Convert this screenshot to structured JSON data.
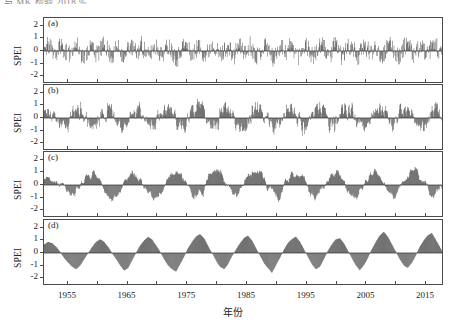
{
  "figure": {
    "top_caption": "与 MK 检验  2018 %",
    "panel_tags": [
      "(a)",
      "(b)",
      "(c)",
      "(d)"
    ],
    "y_axis_label": "SPEI",
    "y_ticks": [
      "2",
      "1",
      "0",
      "-1",
      "-2"
    ],
    "x_axis_title": "年份",
    "x_tick_labels": [
      "1955",
      "1965",
      "1975",
      "1985",
      "1995",
      "2005",
      "2015"
    ],
    "x_minor_ticks": [
      "1960",
      "1970",
      "1980",
      "1990",
      "2000",
      "2010"
    ],
    "colors": {
      "positive": "#3a3a3a",
      "negative": "#4a4a4a",
      "axis": "#4a4a4a",
      "text": "#1a1a1a"
    }
  },
  "chart_data": {
    "type": "line",
    "title": "",
    "subtitle": "",
    "xlabel": "年份",
    "ylabel": "SPEI",
    "xlim": [
      1951,
      2018
    ],
    "ylim": [
      -2.6,
      2.6
    ],
    "yticks": [
      2,
      1,
      0,
      -1,
      -2
    ],
    "xticks": [
      1955,
      1965,
      1975,
      1985,
      1995,
      2005,
      2015
    ],
    "grid": false,
    "legend": null,
    "panels": [
      {
        "tag": "(a)",
        "name": "SPEI-1",
        "ylabel": "SPEI",
        "ylim": [
          -2.6,
          2.6
        ],
        "seed": 11,
        "smooth": 1,
        "amplitude": 1.15,
        "values": [
          0.4,
          1.2,
          0.2,
          -0.6,
          1.5,
          0.3,
          -1.1,
          0.8,
          1.4,
          -0.3,
          -1.6,
          0.6,
          1.1,
          -0.8,
          0.2,
          1.7,
          -0.4,
          -1.2,
          0.9,
          0.1,
          -2.0,
          1.3,
          0.5,
          -0.7,
          1.6,
          -0.2,
          -1.4,
          0.7,
          1.0,
          -1.1,
          0.3,
          1.2,
          -0.5,
          -1.8,
          0.8,
          1.5,
          -0.1,
          -0.9,
          1.1,
          0.4,
          -1.3,
          0.6,
          1.8,
          -0.4,
          -1.0,
          0.9,
          0.2,
          -1.5,
          1.2,
          0.7,
          -0.8,
          1.4,
          -0.3,
          -1.2,
          0.5,
          1.6,
          -0.6,
          -2.2,
          0.8,
          1.0,
          -0.4,
          1.3,
          0.3,
          -1.1,
          0.9,
          1.5,
          -0.7,
          -1.3,
          0.6,
          1.2,
          -0.2,
          -0.9,
          1.4,
          0.5,
          -1.6,
          0.7,
          1.1,
          -0.3,
          -1.4,
          1.0,
          0.4,
          -0.8,
          1.7,
          -0.5,
          -1.1,
          0.8,
          1.3,
          -0.2,
          -1.5,
          0.6,
          1.9,
          -0.4,
          -1.0,
          1.2,
          0.3,
          -1.2,
          0.9,
          1.4,
          -0.6,
          -0.9
        ]
      },
      {
        "tag": "(b)",
        "name": "SPEI-3",
        "ylabel": "SPEI",
        "ylim": [
          -2.6,
          2.6
        ],
        "seed": 23,
        "smooth": 3,
        "amplitude": 1.2,
        "values": [
          0.5,
          0.9,
          1.1,
          0.3,
          -0.5,
          -1.2,
          -0.8,
          0.4,
          1.0,
          1.3,
          0.6,
          -0.4,
          -1.5,
          -1.0,
          0.2,
          0.8,
          1.4,
          0.9,
          -0.3,
          -1.8,
          -1.2,
          0.1,
          0.7,
          1.2,
          1.5,
          0.5,
          -0.6,
          -1.4,
          -0.9,
          0.3,
          1.1,
          1.6,
          0.8,
          -0.2,
          -1.1,
          -1.6,
          -0.5,
          0.6,
          1.3,
          2.2,
          1.0,
          -0.4,
          -1.3,
          -0.7,
          0.4,
          1.0,
          1.5,
          0.7,
          -0.5,
          -1.2,
          -1.7,
          -0.6,
          0.5,
          1.2,
          1.8,
          0.9,
          -0.3,
          -1.0,
          -1.5,
          -0.4,
          0.7,
          1.4,
          1.1,
          0.2,
          -0.8,
          -1.3,
          -0.6,
          0.6,
          1.2,
          1.6,
          0.8,
          -0.4,
          -1.1,
          -1.4,
          -0.3,
          0.9,
          1.3,
          1.0,
          0.1,
          -0.9,
          -1.5,
          -0.7,
          0.5,
          1.1,
          1.7,
          0.6,
          -0.5,
          -1.2,
          -0.8,
          0.4,
          1.0,
          1.4,
          0.9,
          -0.2,
          -1.0,
          -1.3,
          -0.5,
          0.8,
          1.5,
          1.2,
          0.3
        ]
      },
      {
        "tag": "(c)",
        "name": "SPEI-6",
        "ylabel": "SPEI",
        "ylim": [
          -2.6,
          2.6
        ],
        "seed": 37,
        "smooth": 6,
        "amplitude": 1.15,
        "values": [
          0.6,
          0.9,
          1.0,
          0.7,
          0.2,
          -0.4,
          -0.9,
          -1.2,
          -0.8,
          -0.2,
          0.5,
          1.0,
          1.2,
          0.8,
          0.3,
          -0.5,
          -1.1,
          -1.6,
          -1.0,
          -0.3,
          0.6,
          1.1,
          1.4,
          1.0,
          0.4,
          -0.4,
          -1.0,
          -1.5,
          -2.0,
          -1.1,
          -0.2,
          0.7,
          1.2,
          1.5,
          1.1,
          0.3,
          -0.6,
          -1.2,
          -1.4,
          -0.7,
          0.2,
          0.9,
          1.3,
          1.6,
          1.0,
          0.2,
          -0.7,
          -1.3,
          -1.0,
          -0.3,
          0.5,
          1.0,
          1.4,
          1.8,
          1.1,
          0.3,
          -0.5,
          -1.1,
          -1.5,
          -0.8,
          0.1,
          0.8,
          1.2,
          1.5,
          0.9,
          0.2,
          -0.6,
          -1.2,
          -1.3,
          -0.5,
          0.4,
          1.0,
          1.3,
          1.1,
          0.4,
          -0.4,
          -1.0,
          -1.4,
          -0.9,
          -0.1,
          0.7,
          1.2,
          1.6,
          1.0,
          0.2,
          -0.7,
          -1.2,
          -1.1,
          -0.4,
          0.6,
          1.1,
          1.5,
          2.0,
          1.2,
          0.3,
          -0.5,
          -1.0,
          -1.2,
          -0.6,
          0.5
        ]
      },
      {
        "tag": "(d)",
        "name": "SPEI-12",
        "ylabel": "SPEI",
        "ylim": [
          -2.6,
          2.6
        ],
        "seed": 53,
        "smooth": 10,
        "amplitude": 1.1,
        "values": [
          0.7,
          0.9,
          0.8,
          0.5,
          0.1,
          -0.4,
          -0.8,
          -1.1,
          -1.3,
          -1.0,
          -0.5,
          0.0,
          0.5,
          0.9,
          1.1,
          0.9,
          0.5,
          0.0,
          -0.5,
          -1.0,
          -1.4,
          -1.2,
          -0.6,
          0.0,
          0.6,
          1.0,
          1.3,
          1.1,
          0.6,
          0.1,
          -0.5,
          -1.0,
          -1.3,
          -1.5,
          -0.9,
          -0.3,
          0.4,
          0.9,
          1.3,
          1.5,
          1.2,
          0.6,
          0.0,
          -0.6,
          -1.1,
          -1.3,
          -0.9,
          -0.3,
          0.3,
          0.8,
          1.2,
          1.4,
          1.0,
          0.4,
          -0.2,
          -0.8,
          -1.2,
          -1.6,
          -1.0,
          -0.4,
          0.3,
          0.8,
          1.1,
          1.3,
          0.9,
          0.3,
          -0.3,
          -0.9,
          -1.3,
          -1.1,
          -0.5,
          0.2,
          0.7,
          1.1,
          1.2,
          0.8,
          0.2,
          -0.4,
          -1.0,
          -1.4,
          -1.0,
          -0.4,
          0.3,
          0.9,
          1.4,
          1.7,
          1.3,
          0.7,
          0.1,
          -0.5,
          -1.0,
          -1.2,
          -0.8,
          -0.2,
          0.5,
          1.0,
          1.4,
          1.6,
          1.1,
          0.5,
          -0.1
        ]
      }
    ]
  }
}
